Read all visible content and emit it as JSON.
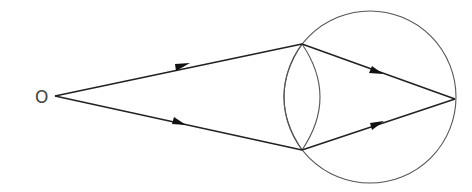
{
  "diagram": {
    "object_label": "O",
    "colors": {
      "stroke": "#222222",
      "outline": "#555555",
      "background": "#ffffff"
    },
    "elements": {
      "object_point": {
        "label": "O",
        "x": 42,
        "y": 97
      },
      "eyeball": {
        "shape": "circle",
        "cx": 370,
        "cy": 97,
        "r": 86
      },
      "lens": {
        "shape": "biconvex",
        "top": [
          302,
          44
        ],
        "bottom": [
          302,
          150
        ]
      },
      "rays": [
        {
          "name": "upper-incident-ray",
          "from": [
            55,
            96
          ],
          "to": [
            302,
            44
          ]
        },
        {
          "name": "lower-incident-ray",
          "from": [
            55,
            96
          ],
          "to": [
            302,
            150
          ]
        },
        {
          "name": "upper-refracted-ray",
          "from": [
            302,
            44
          ],
          "to": [
            455,
            99
          ]
        },
        {
          "name": "lower-refracted-ray",
          "from": [
            302,
            150
          ],
          "to": [
            455,
            99
          ]
        }
      ],
      "image_point": {
        "x": 455,
        "y": 99
      }
    }
  }
}
